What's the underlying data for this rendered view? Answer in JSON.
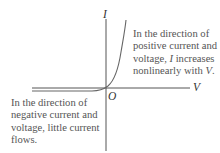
{
  "diagram": {
    "axes": {
      "vertical_label": "I",
      "horizontal_label": "V",
      "origin_label": "O"
    },
    "annotations": {
      "positive": {
        "lines": [
          "In the direction of",
          "positive current and",
          "voltage, I increases",
          "nonlinearly with V."
        ]
      },
      "negative": {
        "lines": [
          "In the direction of",
          "negative current and",
          "voltage, little current",
          "flows."
        ]
      }
    },
    "colors": {
      "axis": "#555555",
      "curve": "#666666",
      "text": "#555555"
    }
  }
}
